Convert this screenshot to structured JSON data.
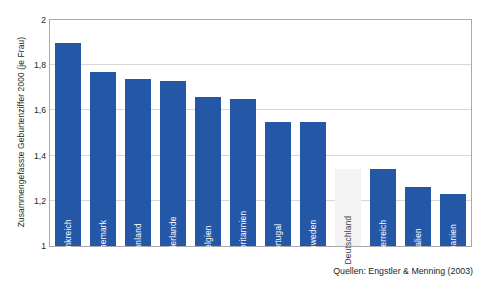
{
  "chart_data": {
    "type": "bar",
    "title": "",
    "subtitle": "",
    "xlabel": "",
    "ylabel": "Zusammengefasste Geburtenziffer 2000 (je Frau)",
    "ylim": [
      1,
      2
    ],
    "ytick_labels": [
      "1",
      "1,2",
      "1,4",
      "1,6",
      "1,8",
      "2"
    ],
    "ytick_values": [
      1,
      1.2,
      1.4,
      1.6,
      1.8,
      2
    ],
    "grid": true,
    "legend": false,
    "categories": [
      "Frankreich",
      "Dänemark",
      "Finnland",
      "Niederlande",
      "Belgien",
      "Großbritannien",
      "Portugal",
      "Schweden",
      "Deutschland",
      "Österreich",
      "Italien",
      "Spanien"
    ],
    "values": [
      1.9,
      1.77,
      1.74,
      1.73,
      1.66,
      1.65,
      1.55,
      1.55,
      1.34,
      1.34,
      1.26,
      1.23
    ],
    "highlight_category": "Deutschland",
    "annotations": [
      "Quellen: Engstler & Menning (2003)"
    ]
  },
  "source_note": "Quellen: Engstler & Menning (2003)",
  "colors": {
    "bar": "#2458a6",
    "bar_highlight": "#f3f3f3",
    "gridline": "#d6d7d9",
    "axis": "#a9a9ac",
    "text": "#231f20",
    "bar_label": "#ffffff",
    "bar_label_highlight": "#3b3b3d",
    "background": "#ffffff"
  }
}
